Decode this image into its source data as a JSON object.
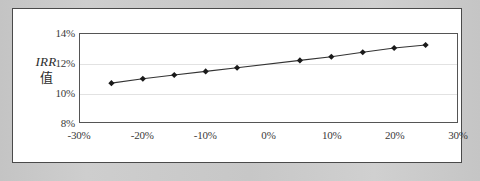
{
  "chart_data": {
    "type": "line",
    "title": "",
    "xlabel": "",
    "ylabel": "IRR 值",
    "ylabel_line1": "IRR",
    "ylabel_line2": "值",
    "grid": true,
    "legend": "none",
    "xlim": [
      -30,
      30
    ],
    "ylim": [
      8,
      14
    ],
    "x_tick_labels": [
      "-30%",
      "-20%",
      "-10%",
      "0%",
      "10%",
      "20%",
      "30%"
    ],
    "x_ticks": [
      -30,
      -20,
      -10,
      0,
      10,
      20,
      30
    ],
    "y_tick_labels": [
      "8%",
      "10%",
      "12%",
      "14%"
    ],
    "y_ticks": [
      8,
      10,
      12,
      14
    ],
    "x": [
      -25,
      -20,
      -15,
      -10,
      -5,
      5,
      10,
      15,
      20,
      25
    ],
    "values": [
      10.65,
      10.95,
      11.2,
      11.45,
      11.7,
      12.2,
      12.45,
      12.75,
      13.05,
      13.25
    ],
    "series": [
      {
        "name": "IRR",
        "marker": "diamond",
        "color": "#1a1a1a",
        "line_color": "#333333",
        "values": [
          10.65,
          10.95,
          11.2,
          11.45,
          11.7,
          12.2,
          12.45,
          12.75,
          13.05,
          13.25
        ]
      }
    ]
  },
  "style": {
    "mat_color": "#c9c9c9",
    "panel_color": "#ffffff",
    "panel_border": "#4a4a4a",
    "axis_color": "#555555",
    "grid_color": "#e2e2e2",
    "tick_text_color": "#3a3a3a",
    "series_color": "#1a1a1a"
  }
}
